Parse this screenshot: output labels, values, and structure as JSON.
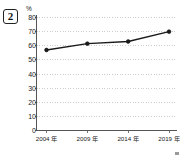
{
  "question": {
    "number": "2"
  },
  "chart_data": {
    "type": "line",
    "title": "",
    "subtitle": "",
    "xlabel": "",
    "ylabel": "",
    "unit_label": "%",
    "categories": [
      "2004 年",
      "2009 年",
      "2014 年",
      "2019 年"
    ],
    "series": [
      {
        "name": "",
        "values": [
          57,
          61.5,
          63,
          70
        ]
      }
    ],
    "ylim": [
      0,
      80
    ],
    "ytick_step": 10,
    "ytick_labels": [
      "80",
      "70",
      "60",
      "50",
      "40",
      "30",
      "20",
      "10",
      "0"
    ],
    "ytick_values": [
      80,
      70,
      60,
      50,
      40,
      30,
      20,
      10,
      0
    ],
    "grid": "horizontal-dotted",
    "legend": "none",
    "marker": "filled-circle",
    "line_color": "#1a1a1a",
    "grid_color": "#b9b9b9",
    "axis_color": "#555555"
  }
}
